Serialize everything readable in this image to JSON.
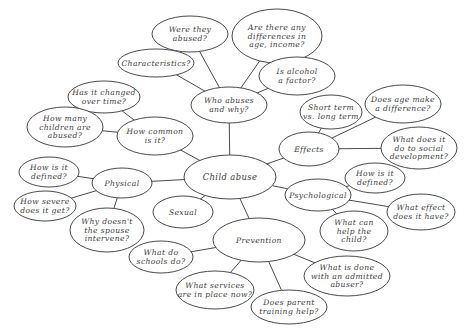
{
  "diagram": {
    "type": "mind-map",
    "colors": {
      "stroke": "#4a4a4a",
      "text": "#3a3a3a",
      "background": "#ffffff"
    },
    "nodes": [
      {
        "id": "child-abuse",
        "lines": [
          "Child abuse"
        ],
        "cx": 230,
        "cy": 177,
        "rx": 46,
        "ry": 22,
        "central": true
      },
      {
        "id": "who-abuses",
        "lines": [
          "Who abuses",
          "and why?"
        ],
        "cx": 229,
        "cy": 105,
        "rx": 38,
        "ry": 18
      },
      {
        "id": "were-they-abused",
        "lines": [
          "Were they",
          "abused?"
        ],
        "cx": 190,
        "cy": 34,
        "rx": 38,
        "ry": 18
      },
      {
        "id": "differences",
        "lines": [
          "Are there any",
          "differences in",
          "age, income?"
        ],
        "cx": 277,
        "cy": 36,
        "rx": 45,
        "ry": 27
      },
      {
        "id": "characteristics",
        "lines": [
          "Characteristics?"
        ],
        "cx": 156,
        "cy": 63,
        "rx": 38,
        "ry": 14
      },
      {
        "id": "alcohol",
        "lines": [
          "Is alcohol",
          "a factor?"
        ],
        "cx": 297,
        "cy": 76,
        "rx": 38,
        "ry": 19
      },
      {
        "id": "how-common",
        "lines": [
          "How common",
          "is it?"
        ],
        "cx": 155,
        "cy": 136,
        "rx": 38,
        "ry": 19
      },
      {
        "id": "changed-over-time",
        "lines": [
          "Has it changed",
          "over time?"
        ],
        "cx": 104,
        "cy": 97,
        "rx": 36,
        "ry": 16
      },
      {
        "id": "how-many-children",
        "lines": [
          "How many",
          "children are",
          "abused?"
        ],
        "cx": 65,
        "cy": 127,
        "rx": 38,
        "ry": 20
      },
      {
        "id": "physical",
        "lines": [
          "Physical"
        ],
        "cx": 122,
        "cy": 183,
        "rx": 30,
        "ry": 15
      },
      {
        "id": "physical-defined",
        "lines": [
          "How is it",
          "defined?"
        ],
        "cx": 49,
        "cy": 172,
        "rx": 30,
        "ry": 15
      },
      {
        "id": "how-severe",
        "lines": [
          "How severe",
          "does it get?"
        ],
        "cx": 45,
        "cy": 206,
        "rx": 31,
        "ry": 15
      },
      {
        "id": "spouse-intervene",
        "lines": [
          "Why doesn't",
          "the spouse",
          "intervene?"
        ],
        "cx": 107,
        "cy": 230,
        "rx": 37,
        "ry": 22
      },
      {
        "id": "sexual",
        "lines": [
          "Sexual"
        ],
        "cx": 183,
        "cy": 212,
        "rx": 30,
        "ry": 16
      },
      {
        "id": "effects",
        "lines": [
          "Effects"
        ],
        "cx": 309,
        "cy": 149,
        "rx": 30,
        "ry": 17
      },
      {
        "id": "short-long-term",
        "lines": [
          "Short term",
          "vs. long term"
        ],
        "cx": 331,
        "cy": 112,
        "rx": 31,
        "ry": 17
      },
      {
        "id": "age-difference",
        "lines": [
          "Does age make",
          "a difference?"
        ],
        "cx": 403,
        "cy": 104,
        "rx": 38,
        "ry": 19
      },
      {
        "id": "social-development",
        "lines": [
          "What does it",
          "do to social",
          "development?"
        ],
        "cx": 419,
        "cy": 148,
        "rx": 38,
        "ry": 21
      },
      {
        "id": "psychological",
        "lines": [
          "Psychological"
        ],
        "cx": 318,
        "cy": 195,
        "rx": 33,
        "ry": 16
      },
      {
        "id": "psych-defined",
        "lines": [
          "How is it",
          "defined?"
        ],
        "cx": 375,
        "cy": 178,
        "rx": 30,
        "ry": 15
      },
      {
        "id": "what-effect",
        "lines": [
          "What effect",
          "does it have?"
        ],
        "cx": 421,
        "cy": 212,
        "rx": 34,
        "ry": 18
      },
      {
        "id": "help-child",
        "lines": [
          "What can",
          "help the",
          "child?"
        ],
        "cx": 354,
        "cy": 231,
        "rx": 34,
        "ry": 20
      },
      {
        "id": "prevention",
        "lines": [
          "Prevention"
        ],
        "cx": 259,
        "cy": 240,
        "rx": 46,
        "ry": 22
      },
      {
        "id": "schools",
        "lines": [
          "What do",
          "schools do?"
        ],
        "cx": 161,
        "cy": 257,
        "rx": 32,
        "ry": 16
      },
      {
        "id": "services",
        "lines": [
          "What services",
          "are in place now?"
        ],
        "cx": 215,
        "cy": 290,
        "rx": 39,
        "ry": 19
      },
      {
        "id": "admitted-abuser",
        "lines": [
          "What is done",
          "with an admitted",
          "abuser?"
        ],
        "cx": 347,
        "cy": 276,
        "rx": 43,
        "ry": 20
      },
      {
        "id": "parent-training",
        "lines": [
          "Does parent",
          "training help?"
        ],
        "cx": 289,
        "cy": 307,
        "rx": 38,
        "ry": 17
      }
    ],
    "edges": [
      [
        "child-abuse",
        "who-abuses"
      ],
      [
        "who-abuses",
        "were-they-abused"
      ],
      [
        "who-abuses",
        "differences"
      ],
      [
        "who-abuses",
        "characteristics"
      ],
      [
        "who-abuses",
        "alcohol"
      ],
      [
        "child-abuse",
        "how-common"
      ],
      [
        "how-common",
        "changed-over-time"
      ],
      [
        "how-common",
        "how-many-children"
      ],
      [
        "child-abuse",
        "physical"
      ],
      [
        "physical",
        "physical-defined"
      ],
      [
        "physical",
        "how-severe"
      ],
      [
        "physical",
        "spouse-intervene"
      ],
      [
        "child-abuse",
        "sexual"
      ],
      [
        "child-abuse",
        "effects"
      ],
      [
        "effects",
        "short-long-term"
      ],
      [
        "effects",
        "age-difference"
      ],
      [
        "effects",
        "social-development"
      ],
      [
        "child-abuse",
        "psychological"
      ],
      [
        "psychological",
        "psych-defined"
      ],
      [
        "psychological",
        "what-effect"
      ],
      [
        "psychological",
        "help-child"
      ],
      [
        "child-abuse",
        "prevention"
      ],
      [
        "prevention",
        "schools"
      ],
      [
        "prevention",
        "services"
      ],
      [
        "prevention",
        "admitted-abuser"
      ],
      [
        "prevention",
        "parent-training"
      ]
    ]
  }
}
